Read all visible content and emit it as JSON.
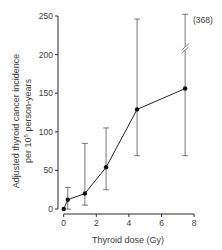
{
  "chart_data": {
    "type": "line",
    "title": "",
    "xlabel": "Thyroid dose (Gy)",
    "ylabel_line1": "Adjusted thyroid cancer incidence",
    "ylabel_line2_prefix": "per 10",
    "ylabel_line2_sup": "5",
    "ylabel_line2_suffix": " person-years",
    "xlim": [
      0,
      8
    ],
    "ylim": [
      0,
      250
    ],
    "xticks": [
      0,
      2,
      4,
      6,
      8
    ],
    "yticks": [
      0,
      50,
      100,
      150,
      200,
      250
    ],
    "grid": false,
    "legend": null,
    "series": [
      {
        "name": "Adjusted incidence",
        "marker": "filled-circle",
        "points": [
          {
            "x": 0.0,
            "y": 0,
            "lower": null,
            "upper": null
          },
          {
            "x": 0.25,
            "y": 12,
            "lower": 0,
            "upper": 28
          },
          {
            "x": 1.3,
            "y": 20,
            "lower": 5,
            "upper": 85
          },
          {
            "x": 2.6,
            "y": 54,
            "lower": 25,
            "upper": 105
          },
          {
            "x": 4.5,
            "y": 129,
            "lower": 69,
            "upper": 246
          },
          {
            "x": 7.45,
            "y": 156,
            "lower": 69,
            "upper": 368,
            "upper_axis_break": true
          }
        ]
      }
    ],
    "annotations": [
      {
        "text": "(368)",
        "attached_to": "upper error bar of last point (axis break)"
      }
    ]
  }
}
